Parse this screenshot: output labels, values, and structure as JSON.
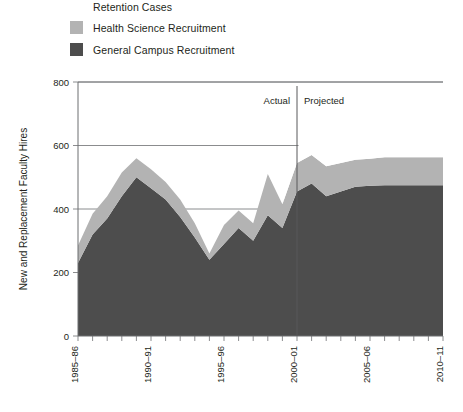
{
  "legend": {
    "items": [
      {
        "label": "Retention Cases",
        "color": "#ffffff"
      },
      {
        "label": "Health Science Recruitment",
        "color": "#b3b3b3"
      },
      {
        "label": "General Campus Recruitment",
        "color": "#4d4d4d"
      }
    ]
  },
  "annotations": {
    "actual": "Actual",
    "projected": "Projected",
    "divider_category": "2000–01"
  },
  "axes": {
    "ylabel": "New and Replacement Faculty Hires",
    "yticks": [
      "0",
      "200",
      "400",
      "600",
      "800"
    ],
    "xticks_labeled": [
      "1985–86",
      "1990–91",
      "1995–96",
      "2000–01",
      "2005–06",
      "2010–11"
    ]
  },
  "chart_data": {
    "type": "area",
    "title": "",
    "subtitle": "",
    "xlabel": "",
    "ylabel": "New and Replacement Faculty Hires",
    "ylim": [
      0,
      800
    ],
    "yticks": [
      0,
      200,
      400,
      600,
      800
    ],
    "grid": true,
    "stacked": true,
    "legend_position": "top-left",
    "categories": [
      "1985–86",
      "1986–87",
      "1987–88",
      "1988–89",
      "1989–90",
      "1990–91",
      "1991–92",
      "1992–93",
      "1993–94",
      "1994–95",
      "1995–96",
      "1996–97",
      "1997–98",
      "1998–99",
      "1999–00",
      "2000–01",
      "2001–02",
      "2002–03",
      "2003–04",
      "2004–05",
      "2005–06",
      "2006–07",
      "2007–08",
      "2008–09",
      "2009–10",
      "2010–11"
    ],
    "series": [
      {
        "name": "General Campus Recruitment",
        "color": "#4d4d4d",
        "values": [
          230,
          320,
          370,
          440,
          500,
          465,
          430,
          375,
          310,
          240,
          290,
          340,
          300,
          380,
          340,
          455,
          480,
          440,
          455,
          470,
          473,
          475,
          475,
          475,
          475,
          475
        ]
      },
      {
        "name": "Health Science Recruitment",
        "color": "#b3b3b3",
        "values": [
          55,
          65,
          70,
          75,
          60,
          60,
          55,
          55,
          45,
          20,
          60,
          55,
          55,
          130,
          75,
          90,
          90,
          95,
          90,
          85,
          85,
          88,
          88,
          88,
          88,
          88
        ]
      },
      {
        "name": "Retention Cases",
        "color": "#ffffff",
        "values": [
          0,
          0,
          0,
          0,
          0,
          0,
          0,
          0,
          0,
          0,
          0,
          0,
          0,
          0,
          0,
          50,
          70,
          90,
          110,
          125,
          130,
          130,
          130,
          130,
          130,
          130
        ]
      }
    ],
    "annotations": [
      {
        "text": "Actual",
        "x": "before 2000–01"
      },
      {
        "text": "Projected",
        "x": "after 2000–01"
      },
      {
        "text": "divider",
        "x": "2000–01"
      }
    ]
  }
}
